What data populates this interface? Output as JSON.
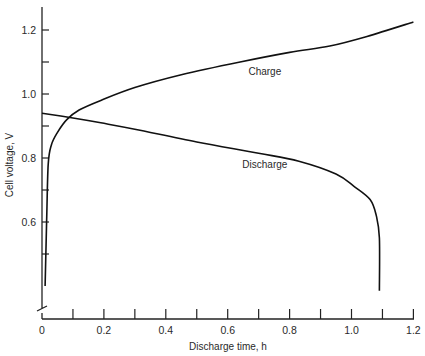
{
  "chart_data": {
    "type": "line",
    "title": "",
    "xlabel": "Discharge time, h",
    "ylabel": "Cell voltage, V",
    "xlim": [
      0,
      1.2
    ],
    "ylim": [
      0.4,
      1.25
    ],
    "y_axis_break": true,
    "grid": false,
    "legend": "none (curves labeled inline)",
    "x_ticks": [
      0,
      0.1,
      0.2,
      0.3,
      0.4,
      0.5,
      0.6,
      0.7,
      0.8,
      0.9,
      1.0,
      1.1,
      1.2
    ],
    "x_tick_labels": [
      "0",
      "",
      "0.2",
      "",
      "0.4",
      "",
      "0.6",
      "",
      "0.8",
      "",
      "1.0",
      "",
      "1.2"
    ],
    "y_ticks": [
      0.5,
      0.6,
      0.7,
      0.8,
      0.9,
      1.0,
      1.1,
      1.2
    ],
    "y_tick_labels": [
      "",
      "0.6",
      "",
      "0.8",
      "",
      "1.0",
      "",
      "1.2"
    ],
    "series": [
      {
        "name": "Charge",
        "x": [
          0.01,
          0.015,
          0.02,
          0.03,
          0.05,
          0.08,
          0.12,
          0.19,
          0.3,
          0.45,
          0.64,
          0.8,
          0.93,
          1.05,
          1.2
        ],
        "y": [
          0.4,
          0.6,
          0.78,
          0.84,
          0.88,
          0.92,
          0.95,
          0.98,
          1.02,
          1.06,
          1.1,
          1.13,
          1.15,
          1.18,
          1.225
        ]
      },
      {
        "name": "Discharge",
        "x": [
          0.0,
          0.1,
          0.19,
          0.3,
          0.5,
          0.7,
          0.83,
          0.95,
          1.01,
          1.06,
          1.08,
          1.09,
          1.09
        ],
        "y": [
          0.94,
          0.925,
          0.91,
          0.89,
          0.85,
          0.815,
          0.79,
          0.75,
          0.71,
          0.67,
          0.62,
          0.55,
          0.385
        ]
      }
    ],
    "annotations": [
      {
        "text": "Charge",
        "x": 0.72,
        "y": 1.06
      },
      {
        "text": "Discharge",
        "x": 0.72,
        "y": 0.77
      }
    ]
  }
}
